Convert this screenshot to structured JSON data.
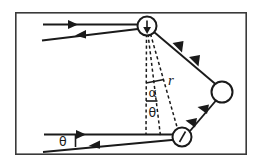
{
  "figure": {
    "background_color": "#ffffff",
    "stroke_color": "#1a1a1a",
    "frame_color": "#3a3a3a",
    "width": 262,
    "height": 167
  },
  "labels": {
    "alpha": "α",
    "theta_upper": "θ",
    "theta_lower": "θ",
    "radius": "r"
  },
  "nodes": [
    {
      "id": "node-top",
      "name": "upper-scatter-node",
      "cx": 147,
      "cy": 26,
      "r": 9.5
    },
    {
      "id": "node-right",
      "name": "right-scatter-node",
      "cx": 222,
      "cy": 92,
      "r": 10.5
    },
    {
      "id": "node-bottom",
      "name": "lower-scatter-node",
      "cx": 182,
      "cy": 137,
      "r": 9.5
    }
  ],
  "frame": {
    "x": 15,
    "y": 12,
    "width": 232,
    "height": 143
  },
  "rays": {
    "upper_incoming": "horizontal ray entering from left toward upper node",
    "upper_outgoing": "slanted ray exiting to lower left from upper node",
    "node_top_to_right": "ray between upper node and right node",
    "node_right_to_bottom": "ray between right node and lower node",
    "lower_incoming": "horizontal ray entering from left toward lower node",
    "lower_outgoing": "slanted ray exiting to lower left from lower node"
  },
  "dashed_guides": {
    "vertical": "vertical reference line dropped from upper node",
    "theta_line": "line at angle theta from vertical",
    "r_line": "line of length r from upper node to lower node"
  }
}
